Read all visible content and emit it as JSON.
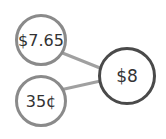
{
  "diagram": {
    "nodes": [
      {
        "id": "top",
        "label": "$7.65"
      },
      {
        "id": "bottom",
        "label": "35¢"
      },
      {
        "id": "total",
        "label": "$8"
      }
    ],
    "edges": [
      {
        "from": "top",
        "to": "total"
      },
      {
        "from": "bottom",
        "to": "total"
      }
    ],
    "colors": {
      "part_border": "#8a8a8a",
      "whole_border": "#4a4a4a",
      "edge": "#a0a0a0"
    }
  }
}
